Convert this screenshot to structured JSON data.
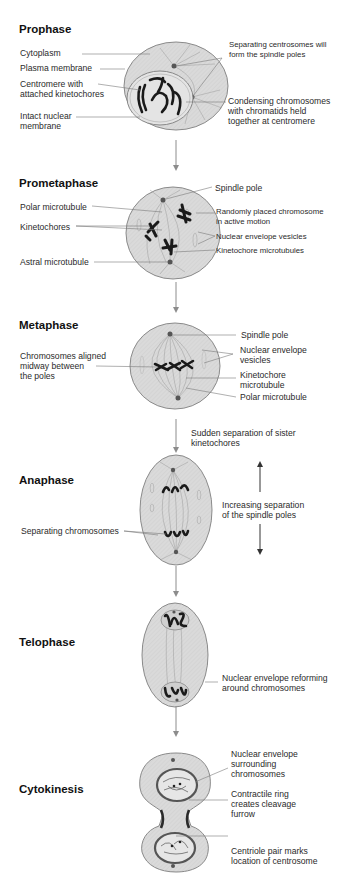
{
  "figure": {
    "stages": [
      {
        "name": "Prophase",
        "labels_left": [
          "Cytoplasm",
          "Plasma membrane",
          "Centromere with\nattached kinetochores",
          "Intact nuclear\nmembrane"
        ],
        "labels_right": [
          "Separating centrosomes will\nform the spindle poles",
          "Condensing chromosomes\nwith chromatids held\ntogether at centromere"
        ]
      },
      {
        "name": "Prometaphase",
        "labels_left": [
          "Polar microtubule",
          "Kinetochores",
          "Astral microtubule"
        ],
        "labels_right": [
          "Spindle pole",
          "Randomly placed chromosome\nin active motion",
          "Nuclear envelope vesicles",
          "Kinetochore microtubules"
        ]
      },
      {
        "name": "Metaphase",
        "labels_left": [
          "Chromosomes aligned\nmidway between\nthe poles"
        ],
        "labels_right": [
          "Spindle pole",
          "Nuclear envelope\nvesicles",
          "Kinetochore\nmicrotubule",
          "Polar microtubule"
        ]
      },
      {
        "name": "Anaphase",
        "transition_note": "Sudden separation of sister\nkinetochores",
        "labels_left": [
          "Separating chromosomes"
        ],
        "labels_right": [
          "Increasing separation\nof the spindle poles"
        ]
      },
      {
        "name": "Telophase",
        "labels_right": [
          "Nuclear envelope reforming\naround chromosomes"
        ]
      },
      {
        "name": "Cytokinesis",
        "labels_right": [
          "Nuclear envelope\nsurrounding\nchromosomes",
          "Contractile ring\ncreates cleavage\nfurrow",
          "Centriole pair marks\nlocation of centrosome"
        ]
      }
    ],
    "colors": {
      "cell_fill": "#d9d9d9",
      "cell_stroke": "#8a8a8a",
      "chromosome": "#1a1a1a",
      "arrow": "#8c8c8c",
      "leader_line": "#7a7a7a"
    }
  }
}
